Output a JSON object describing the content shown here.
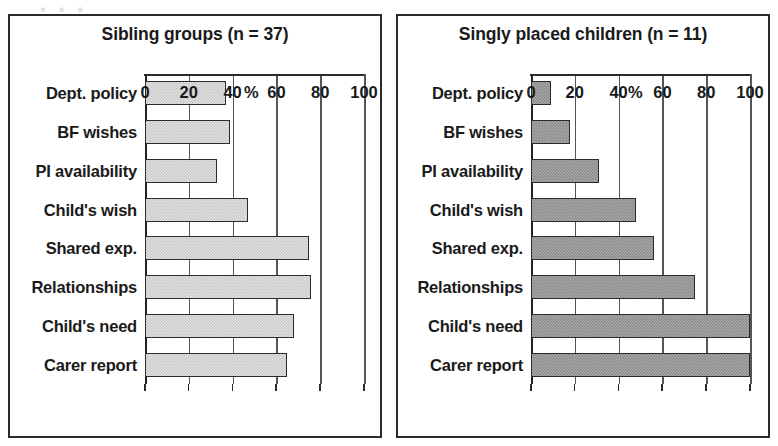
{
  "figure": {
    "scan_bleed_text": "• • •",
    "axis_unit_label": "%",
    "axis_ticks": [
      0,
      20,
      40,
      60,
      80,
      100
    ],
    "categories": [
      "Dept. policy",
      "BF wishes",
      "PI availability",
      "Child's wish",
      "Shared exp.",
      "Relationships",
      "Child's need",
      "Carer report"
    ],
    "colors": {
      "panel_border": "#2b2b2b",
      "bar_outline": "#2b2b2b",
      "bar_fill_left": "#c9c9c9",
      "bar_fill_right": "#8c8c8c",
      "gridline": "#555555",
      "text": "#1a1a1a",
      "background": "#ffffff"
    }
  },
  "chart_data": [
    {
      "type": "bar",
      "orientation": "horizontal",
      "title": "Sibling groups (n = 37)",
      "xlabel": "%",
      "ylabel": "",
      "xlim": [
        0,
        100
      ],
      "xticks": [
        0,
        20,
        40,
        60,
        80,
        100
      ],
      "grid": true,
      "legend": "none",
      "categories": [
        "Dept. policy",
        "BF wishes",
        "PI availability",
        "Child's wish",
        "Shared exp.",
        "Relationships",
        "Child's need",
        "Carer report"
      ],
      "values": [
        37,
        39,
        33,
        47,
        75,
        76,
        68,
        65
      ]
    },
    {
      "type": "bar",
      "orientation": "horizontal",
      "title": "Singly placed children (n = 11)",
      "xlabel": "%",
      "ylabel": "",
      "xlim": [
        0,
        100
      ],
      "xticks": [
        0,
        20,
        40,
        60,
        80,
        100
      ],
      "grid": true,
      "legend": "none",
      "categories": [
        "Dept. policy",
        "BF wishes",
        "PI availability",
        "Child's wish",
        "Shared exp.",
        "Relationships",
        "Child's need",
        "Carer report"
      ],
      "values": [
        9,
        18,
        31,
        48,
        56,
        75,
        100,
        100
      ]
    }
  ]
}
